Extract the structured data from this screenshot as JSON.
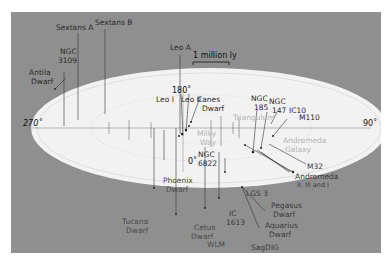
{
  "diagram": {
    "colors": {
      "background": "#8f8f8f",
      "plane": "#f4f4f4",
      "plane_edge": "#ffffff",
      "dark_text": "#222222",
      "light_text": "#b8b8b8",
      "line": "#333333"
    },
    "scale_bar": {
      "label": "1 million ly"
    },
    "angles": {
      "top": "180˚",
      "left": "270˚",
      "right": "90˚",
      "bottom": "0˚"
    },
    "galaxies_above": {
      "ngc3109_line1": "NGC",
      "ngc3109_line2": "3109",
      "antlia_line1": "Antila",
      "antlia_line2": "Dwarf",
      "sextans_a": "Sextans A",
      "sextans_b": "Sextans B",
      "leo_a": "Leo A",
      "leo_i": "Leo I",
      "leo_ii": "Leo II",
      "canes_line1": "Canes",
      "canes_line2": "Dwarf",
      "ngc185_line1": "NGC",
      "ngc185_line2": "185",
      "ngc147_line1": "NGC",
      "ngc147_line2": "147",
      "ic10": "IC10",
      "m110": "M110",
      "ngc6822_line1": "NGC",
      "ngc6822_line2": "6822"
    },
    "galaxies_in_plane": {
      "triangulum": "Triangulum",
      "milky_way_line1": "Milky",
      "milky_way_line2": "Way",
      "andromeda_line1": "Andromeda",
      "andromeda_line2": "Galaxy"
    },
    "galaxies_below": {
      "m32": "M32",
      "andromeda_sat_line1": "Andromeda",
      "andromeda_sat_line2": "II, III and I",
      "phoenix_line1": "Phoenix",
      "phoenix_line2": "Dwarf",
      "tucana_line1": "Tucana",
      "tucana_line2": "Dwarf",
      "lgs3": "LGS 3",
      "ic1613_line1": "IC",
      "ic1613_line2": "1613",
      "pegasus_line1": "Pegasus",
      "pegasus_line2": "Dwarf",
      "cetus_line1": "Cetus",
      "cetus_line2": "Dwarf",
      "aquarius_line1": "Aquarius",
      "aquarius_line2": "Dwarf",
      "wlm": "WLM",
      "sagdig": "SagDIG"
    }
  }
}
